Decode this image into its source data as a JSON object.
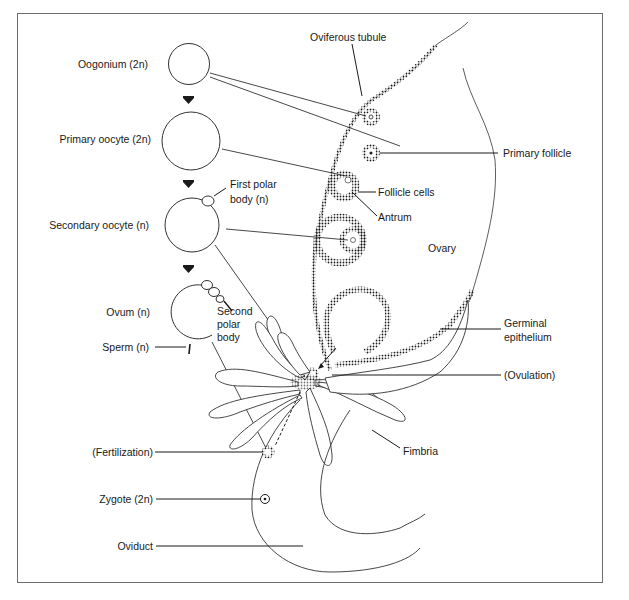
{
  "figure": {
    "stages": [
      {
        "id": "oogonium",
        "label": "Oogonium (2n)"
      },
      {
        "id": "primary_oocyte",
        "label": "Primary oocyte (2n)"
      },
      {
        "id": "secondary_oocyte",
        "label": "Secondary oocyte (n)"
      },
      {
        "id": "ovum",
        "label": "Ovum (n)"
      }
    ],
    "labels": {
      "oviferous_tubule": "Oviferous tubule",
      "primary_follicle": "Primary follicle",
      "first_polar_body_1": "First polar",
      "first_polar_body_2": "body (n)",
      "follicle_cells": "Follicle cells",
      "antrum": "Antrum",
      "ovary": "Ovary",
      "second_polar_body_1": "Second",
      "second_polar_body_2": "polar",
      "second_polar_body_3": "body",
      "sperm": "Sperm (n)",
      "germinal_epithelium_1": "Germinal",
      "germinal_epithelium_2": "epithelium",
      "ovulation": "(Ovulation)",
      "fimbria": "Fimbria",
      "fertilization": "(Fertilization)",
      "zygote": "Zygote (2n)",
      "oviduct": "Oviduct"
    },
    "colors": {
      "ink": "#1a1a1a",
      "frame": "#6e6e6e",
      "background": "#ffffff"
    }
  }
}
